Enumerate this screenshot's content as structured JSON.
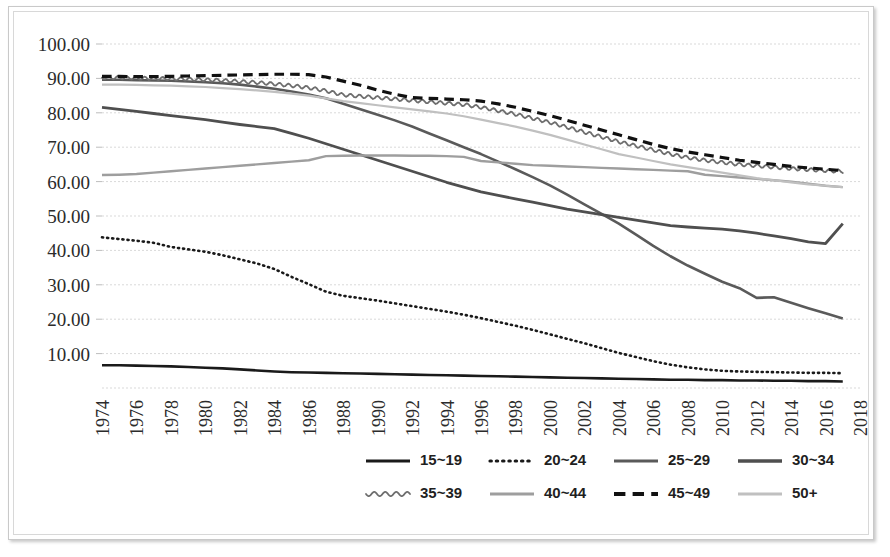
{
  "chart_data": {
    "type": "line",
    "title": "",
    "subtitle": "",
    "xlabel": "",
    "ylabel": "",
    "grid": true,
    "legend_position": "bottom",
    "ylim": [
      0,
      100
    ],
    "ytick_labels": [
      "10.00",
      "20.00",
      "30.00",
      "40.00",
      "50.00",
      "60.00",
      "70.00",
      "80.00",
      "90.00",
      "100.00"
    ],
    "ytick_values": [
      10,
      20,
      30,
      40,
      50,
      60,
      70,
      80,
      90,
      100
    ],
    "ytick_step": 10,
    "x": [
      1974,
      1975,
      1976,
      1977,
      1978,
      1979,
      1980,
      1981,
      1982,
      1983,
      1984,
      1985,
      1986,
      1987,
      1988,
      1989,
      1990,
      1991,
      1992,
      1993,
      1994,
      1995,
      1996,
      1997,
      1998,
      1999,
      2000,
      2001,
      2002,
      2003,
      2004,
      2005,
      2006,
      2007,
      2008,
      2009,
      2010,
      2011,
      2012,
      2013,
      2014,
      2015,
      2016,
      2017
    ],
    "xtick_labels": [
      "1974",
      "1976",
      "1978",
      "1980",
      "1982",
      "1984",
      "1986",
      "1988",
      "1990",
      "1992",
      "1994",
      "1996",
      "1998",
      "2000",
      "2002",
      "2004",
      "2006",
      "2008",
      "2010",
      "2012",
      "2014",
      "2016",
      "2018"
    ],
    "xlim": [
      1974,
      2018
    ],
    "series": [
      {
        "name": "15~19",
        "style": "solid",
        "color": "#1a1a1a",
        "width": 2.6,
        "values": [
          6.6,
          6.6,
          6.5,
          6.4,
          6.3,
          6.1,
          5.9,
          5.7,
          5.4,
          5.1,
          4.8,
          4.6,
          4.5,
          4.4,
          4.3,
          4.2,
          4.1,
          4.0,
          3.9,
          3.8,
          3.7,
          3.6,
          3.5,
          3.4,
          3.3,
          3.2,
          3.1,
          3.0,
          2.9,
          2.8,
          2.7,
          2.6,
          2.5,
          2.4,
          2.4,
          2.3,
          2.3,
          2.2,
          2.2,
          2.1,
          2.1,
          2.0,
          2.0,
          1.9
        ]
      },
      {
        "name": "20~24",
        "style": "dotted",
        "color": "#1a1a1a",
        "width": 2.6,
        "values": [
          43.8,
          43.3,
          42.8,
          42.2,
          41.0,
          40.3,
          39.6,
          38.6,
          37.4,
          36.2,
          34.6,
          32.3,
          30.2,
          28.0,
          26.8,
          26.1,
          25.4,
          24.6,
          23.8,
          23.0,
          22.2,
          21.3,
          20.3,
          19.2,
          18.1,
          16.9,
          15.6,
          14.3,
          13.0,
          11.6,
          10.2,
          9.0,
          7.8,
          6.8,
          6.0,
          5.4,
          5.0,
          4.8,
          4.7,
          4.6,
          4.5,
          4.4,
          4.4,
          4.3
        ]
      },
      {
        "name": "25~29",
        "style": "solid",
        "color": "#5a5a5a",
        "width": 2.6,
        "values": [
          89.6,
          89.6,
          89.5,
          89.4,
          89.3,
          89.1,
          88.9,
          88.6,
          88.2,
          87.6,
          87.0,
          86.2,
          85.3,
          84.2,
          82.6,
          81.0,
          79.4,
          77.8,
          76.0,
          74.0,
          72.0,
          70.0,
          68.0,
          65.8,
          63.6,
          61.3,
          58.9,
          56.2,
          53.4,
          50.6,
          47.8,
          44.6,
          41.3,
          38.3,
          35.6,
          33.2,
          30.9,
          29.0,
          26.2,
          26.4,
          24.8,
          23.2,
          21.7,
          20.2
        ]
      },
      {
        "name": "30~34",
        "style": "solid",
        "color": "#4f4f4f",
        "width": 2.8,
        "values": [
          81.6,
          81.0,
          80.4,
          79.8,
          79.2,
          78.6,
          78.0,
          77.3,
          76.6,
          76.0,
          75.4,
          74.0,
          72.6,
          71.0,
          69.4,
          67.8,
          66.2,
          64.6,
          63.0,
          61.4,
          59.8,
          58.4,
          57.0,
          56.0,
          55.0,
          54.0,
          53.0,
          52.0,
          51.2,
          50.4,
          49.6,
          48.8,
          48.0,
          47.2,
          46.8,
          46.5,
          46.2,
          45.7,
          45.0,
          44.2,
          43.4,
          42.5,
          42.0,
          47.8
        ]
      },
      {
        "name": "35~39",
        "style": "wavy",
        "color": "#6e6e6e",
        "width": 1.8,
        "values": [
          90.2,
          90.2,
          90.1,
          90.0,
          89.9,
          89.8,
          89.6,
          89.4,
          89.1,
          88.8,
          88.4,
          87.9,
          87.3,
          86.4,
          85.2,
          84.8,
          84.4,
          84.0,
          83.6,
          83.2,
          82.8,
          82.4,
          81.6,
          80.6,
          79.6,
          78.4,
          77.2,
          75.8,
          74.4,
          73.0,
          71.6,
          70.4,
          69.2,
          68.0,
          67.0,
          66.2,
          65.6,
          65.0,
          64.6,
          64.2,
          63.8,
          63.5,
          63.2,
          63.0
        ]
      },
      {
        "name": "40~44",
        "style": "solid",
        "color": "#9e9e9e",
        "width": 2.4,
        "values": [
          61.9,
          62.0,
          62.2,
          62.6,
          63.0,
          63.4,
          63.8,
          64.2,
          64.6,
          65.0,
          65.4,
          65.8,
          66.2,
          67.4,
          67.5,
          67.6,
          67.6,
          67.6,
          67.5,
          67.5,
          67.4,
          67.2,
          66.0,
          65.6,
          65.2,
          64.8,
          64.6,
          64.4,
          64.2,
          64.0,
          63.8,
          63.6,
          63.4,
          63.2,
          63.0,
          62.0,
          61.6,
          61.2,
          60.8,
          60.4,
          60.0,
          59.4,
          58.8,
          58.4
        ]
      },
      {
        "name": "45~49",
        "style": "dashed",
        "color": "#111111",
        "width": 3.2,
        "values": [
          90.6,
          90.6,
          90.5,
          90.5,
          90.6,
          90.7,
          90.8,
          90.9,
          91.0,
          91.1,
          91.2,
          91.2,
          91.1,
          90.4,
          89.2,
          88.0,
          86.6,
          85.4,
          84.4,
          84.2,
          84.0,
          83.8,
          83.4,
          82.6,
          81.6,
          80.4,
          79.2,
          77.8,
          76.4,
          75.0,
          73.6,
          72.2,
          70.8,
          69.6,
          68.6,
          67.8,
          67.0,
          66.2,
          65.6,
          65.0,
          64.4,
          64.0,
          63.6,
          63.2
        ]
      },
      {
        "name": "50+",
        "style": "solid",
        "color": "#c0c0c0",
        "width": 2.2,
        "values": [
          88.2,
          88.2,
          88.1,
          88.0,
          87.9,
          87.7,
          87.5,
          87.2,
          86.9,
          86.5,
          86.1,
          85.6,
          85.0,
          84.2,
          83.4,
          82.8,
          82.2,
          81.6,
          81.0,
          80.4,
          79.8,
          79.0,
          78.0,
          77.0,
          76.0,
          74.8,
          73.6,
          72.2,
          70.8,
          69.4,
          68.0,
          67.0,
          66.0,
          65.0,
          64.2,
          63.4,
          62.6,
          61.8,
          61.0,
          60.4,
          59.8,
          59.2,
          58.8,
          58.4
        ]
      }
    ]
  },
  "legend": {
    "entries": [
      {
        "label": "15~19",
        "style": "solid",
        "color": "#1a1a1a"
      },
      {
        "label": "20~24",
        "style": "dotted",
        "color": "#1a1a1a"
      },
      {
        "label": "25~29",
        "style": "solid",
        "color": "#5a5a5a"
      },
      {
        "label": "30~34",
        "style": "solid",
        "color": "#4f4f4f"
      },
      {
        "label": "35~39",
        "style": "wavy",
        "color": "#6e6e6e"
      },
      {
        "label": "40~44",
        "style": "solid",
        "color": "#9e9e9e"
      },
      {
        "label": "45~49",
        "style": "dashed",
        "color": "#111111"
      },
      {
        "label": "50+",
        "style": "solid",
        "color": "#c0c0c0"
      }
    ]
  },
  "colors": {
    "gridline": "#d9d9d9",
    "axis": "#bdbdbd",
    "text": "#2b2b2b",
    "frame": "#c9c9c9",
    "background": "#ffffff"
  }
}
